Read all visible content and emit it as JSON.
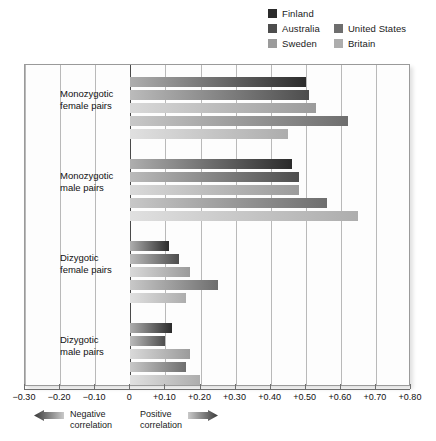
{
  "chart_data": {
    "type": "bar",
    "orientation": "horizontal",
    "title": "",
    "xlabel": "",
    "ylabel": "",
    "xlim": [
      -0.3,
      0.8
    ],
    "grid": true,
    "legend_position": "top-right",
    "categories": [
      "Monozygotic female pairs",
      "Monozygotic male pairs",
      "Dizygotic female pairs",
      "Dizygotic male pairs"
    ],
    "category_lines": [
      [
        "Monozygotic",
        "female pairs"
      ],
      [
        "Monozygotic",
        "male pairs"
      ],
      [
        "Dizygotic",
        "female pairs"
      ],
      [
        "Dizygotic",
        "male pairs"
      ]
    ],
    "tick_labels": [
      "-0.30",
      "-0.20",
      "-0.10",
      "0",
      "+0.10",
      "+0.20",
      "+0.30",
      "+0.40",
      "+0.50",
      "+0.60",
      "+0.70",
      "+0.80"
    ],
    "tick_values": [
      -0.3,
      -0.2,
      -0.1,
      0,
      0.1,
      0.2,
      0.3,
      0.4,
      0.5,
      0.6,
      0.7,
      0.8
    ],
    "series": [
      {
        "name": "Finland",
        "color": "#2b2b2b",
        "values": [
          0.5,
          0.46,
          0.11,
          0.12
        ]
      },
      {
        "name": "Australia",
        "color": "#4d4d4d",
        "values": [
          0.51,
          0.48,
          0.14,
          0.1
        ]
      },
      {
        "name": "Sweden",
        "color": "#9b9b9b",
        "values": [
          0.53,
          0.48,
          0.17,
          0.17
        ]
      },
      {
        "name": "United States",
        "color": "#6e6e6e",
        "values": [
          0.62,
          0.56,
          0.25,
          0.16
        ]
      },
      {
        "name": "Britain",
        "color": "#adadad",
        "values": [
          0.45,
          0.65,
          0.16,
          0.2
        ]
      }
    ]
  },
  "legend": {
    "items": [
      {
        "label": "Finland",
        "color": "#2b2b2b"
      },
      {
        "label": "Australia",
        "color": "#4d4d4d"
      },
      {
        "label": "United States",
        "color": "#6e6e6e"
      },
      {
        "label": "Sweden",
        "color": "#9b9b9b"
      },
      {
        "label": "Britain",
        "color": "#adadad"
      }
    ]
  },
  "footnotes": {
    "negative": {
      "line1": "Negative",
      "line2": "correlation",
      "icon": "left-arrow-icon"
    },
    "positive": {
      "line1": "Positive",
      "line2": "correlation",
      "icon": "right-arrow-icon"
    }
  }
}
